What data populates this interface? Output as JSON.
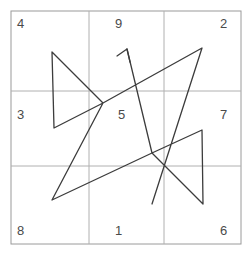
{
  "figure": {
    "canvas": {
      "width": 251,
      "height": 260,
      "background": "#ffffff"
    },
    "frame": {
      "x": 11,
      "y": 11,
      "width": 230,
      "height": 233,
      "stroke": "#9a9a9a",
      "stroke_width": 1
    },
    "grid": {
      "rows": 3,
      "cols": 3,
      "vertical_lines_x": [
        89,
        164
      ],
      "horizontal_lines_y": [
        91,
        166
      ],
      "stroke": "#b0b0b0",
      "stroke_width": 1
    },
    "cells": [
      {
        "name": "cell-top-left",
        "value": "4",
        "x": 17,
        "y": 17,
        "align": "left"
      },
      {
        "name": "cell-top-center",
        "value": "9",
        "x": 119,
        "y": 17,
        "align": "center"
      },
      {
        "name": "cell-top-right",
        "value": "2",
        "x": 228,
        "y": 17,
        "align": "right"
      },
      {
        "name": "cell-middle-left",
        "value": "3",
        "x": 17,
        "y": 108,
        "align": "left"
      },
      {
        "name": "cell-middle-center",
        "value": "5",
        "x": 122,
        "y": 108,
        "align": "center"
      },
      {
        "name": "cell-middle-right",
        "value": "7",
        "x": 228,
        "y": 108,
        "align": "right"
      },
      {
        "name": "cell-bottom-left",
        "value": "8",
        "x": 17,
        "y": 224,
        "align": "left"
      },
      {
        "name": "cell-bottom-center",
        "value": "1",
        "x": 119,
        "y": 224,
        "align": "center"
      },
      {
        "name": "cell-bottom-right",
        "value": "6",
        "x": 228,
        "y": 224,
        "align": "right"
      }
    ],
    "path": {
      "stroke": "#3c3c3c",
      "stroke_width": 1.3,
      "d": "M 52 52 L 103 103 L 54 128 L 52 52 M 103 103 L 202 48 L 152 204 M 52 200 L 152 153 L 202 130 L 203 204 L 152 153 M 103 103 L 52 200 M 127 49 L 152 153",
      "segments": [
        {
          "name": "left-triangle-upper-edge",
          "from": [
            52,
            52
          ],
          "to": [
            103,
            103
          ]
        },
        {
          "name": "left-triangle-lower-edge",
          "from": [
            103,
            103
          ],
          "to": [
            54,
            128
          ]
        },
        {
          "name": "left-triangle-vertical",
          "from": [
            54,
            128
          ],
          "to": [
            52,
            52
          ]
        },
        {
          "name": "center-to-top-right",
          "from": [
            103,
            103
          ],
          "to": [
            202,
            48
          ]
        },
        {
          "name": "top-right-to-bottom",
          "from": [
            202,
            48
          ],
          "to": [
            152,
            204
          ]
        },
        {
          "name": "bottom-left-diagonal",
          "from": [
            52,
            200
          ],
          "to": [
            152,
            153
          ]
        },
        {
          "name": "right-triangle-upper-edge",
          "from": [
            152,
            153
          ],
          "to": [
            202,
            130
          ]
        },
        {
          "name": "right-triangle-vertical",
          "from": [
            202,
            130
          ],
          "to": [
            203,
            204
          ]
        },
        {
          "name": "right-triangle-lower-edge",
          "from": [
            203,
            204
          ],
          "to": [
            152,
            153
          ]
        },
        {
          "name": "center-to-bottom-left",
          "from": [
            103,
            103
          ],
          "to": [
            52,
            200
          ]
        },
        {
          "name": "arrow-shaft",
          "from": [
            152,
            153
          ],
          "to": [
            127,
            49
          ]
        }
      ]
    },
    "arrow": {
      "name": "arrowhead",
      "tip": [
        127,
        49
      ],
      "direction": "up-right",
      "stroke": "#3c3c3c",
      "stroke_width": 1.3,
      "barb_left": [
        117,
        56
      ],
      "barb_right": [
        130,
        62
      ]
    }
  }
}
